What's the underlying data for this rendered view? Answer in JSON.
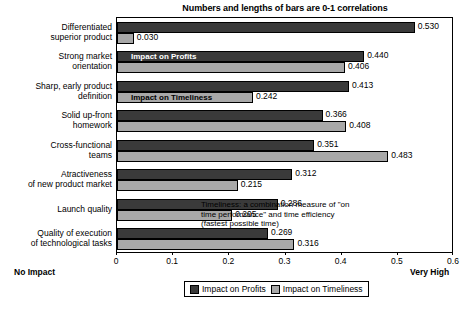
{
  "chart_data": {
    "type": "bar",
    "orientation": "horizontal",
    "title": "Numbers and lengths of bars are 0-1 correlations",
    "xlabel": "",
    "ylabel": "",
    "xlim": [
      0,
      0.6
    ],
    "xticks": [
      "0",
      "0.1",
      "0.2",
      "0.3",
      "0.4",
      "0.5",
      "0.6"
    ],
    "xtick_values": [
      0,
      0.1,
      0.2,
      0.3,
      0.4,
      0.5,
      0.6
    ],
    "grid": false,
    "legend_position": "bottom",
    "axis_endpoint_left": "No Impact",
    "axis_endpoint_right": "Very High",
    "annotation": "Timeliness: a combination measure of \"on time performance\" and time efficiency (fastest possible time)",
    "categories": [
      "Differentiated superior product",
      "Strong market orientation",
      "Sharp, early product definition",
      "Solid up-front homework",
      "Cross-functional teams",
      "Atractiveness of new product market",
      "Launch quality",
      "Quality of execution of technological tasks"
    ],
    "category_lines": [
      [
        "Differentiated",
        "superior product"
      ],
      [
        "Strong market",
        "orientation"
      ],
      [
        "Sharp, early product",
        "definition"
      ],
      [
        "Solid up-front",
        "homework"
      ],
      [
        "Cross-functional",
        "teams"
      ],
      [
        "Atractiveness",
        "of new product market"
      ],
      [
        "Launch quality"
      ],
      [
        "Quality of execution",
        "of technological tasks"
      ]
    ],
    "series": [
      {
        "name": "Impact on Profits",
        "color": "#3a3a3a",
        "values": [
          0.53,
          0.44,
          0.413,
          0.366,
          0.351,
          0.312,
          0.286,
          0.269
        ],
        "labels": [
          "0.530",
          "0.440",
          "0.413",
          "0.366",
          "0.351",
          "0.312",
          "0.286",
          "0.269"
        ]
      },
      {
        "name": "Impact on Timeliness",
        "color": "#a8a8a8",
        "values": [
          0.03,
          0.406,
          0.242,
          0.408,
          0.483,
          0.215,
          0.205,
          0.316
        ],
        "labels": [
          "0.030",
          "0.406",
          "0.242",
          "0.408",
          "0.483",
          "0.215",
          "0.205",
          "0.316"
        ]
      }
    ],
    "inbar_labels": [
      {
        "text": "Impact on Profits",
        "series": 0,
        "category_index": 1
      },
      {
        "text": "Impact on Timeliness",
        "series": 1,
        "category_index": 2
      }
    ]
  },
  "legend": {
    "items": [
      {
        "label": "Impact on Profits",
        "color": "#3a3a3a"
      },
      {
        "label": "Impact on Timeliness",
        "color": "#a8a8a8"
      }
    ]
  }
}
